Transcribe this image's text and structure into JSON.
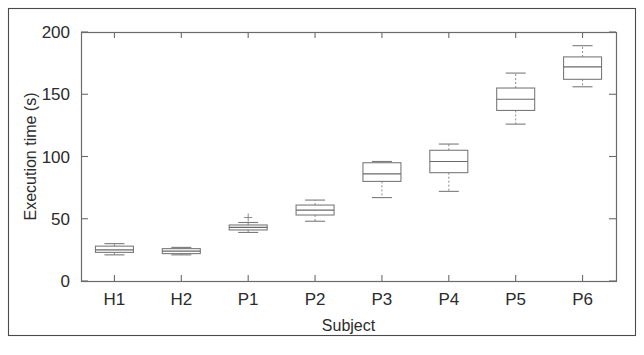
{
  "chart_data": {
    "type": "box",
    "title": "",
    "xlabel": "Subject",
    "ylabel": "Execution time (s)",
    "categories": [
      "H1",
      "H2",
      "P1",
      "P2",
      "P3",
      "P4",
      "P5",
      "P6"
    ],
    "ylim": [
      0,
      200
    ],
    "yticks": [
      0,
      50,
      100,
      150,
      200
    ],
    "ytick_labels": [
      "0",
      "50",
      "100",
      "150",
      "200"
    ],
    "grid": false,
    "legend": null,
    "boxes": [
      {
        "category": "H1",
        "whisker_low": 21,
        "q1": 23,
        "median": 25,
        "q3": 28,
        "whisker_high": 30,
        "outliers": []
      },
      {
        "category": "H2",
        "whisker_low": 21,
        "q1": 22,
        "median": 24,
        "q3": 26,
        "whisker_high": 27,
        "outliers": []
      },
      {
        "category": "P1",
        "whisker_low": 39,
        "q1": 41,
        "median": 43,
        "q3": 45,
        "whisker_high": 47,
        "outliers": [
          51
        ]
      },
      {
        "category": "P2",
        "whisker_low": 48,
        "q1": 53,
        "median": 57,
        "q3": 61,
        "whisker_high": 65,
        "outliers": []
      },
      {
        "category": "P3",
        "whisker_low": 67,
        "q1": 80,
        "median": 86,
        "q3": 95,
        "whisker_high": 96,
        "outliers": []
      },
      {
        "category": "P4",
        "whisker_low": 72,
        "q1": 87,
        "median": 96,
        "q3": 105,
        "whisker_high": 110,
        "outliers": []
      },
      {
        "category": "P5",
        "whisker_low": 126,
        "q1": 137,
        "median": 146,
        "q3": 155,
        "whisker_high": 167,
        "outliers": []
      },
      {
        "category": "P6",
        "whisker_low": 156,
        "q1": 162,
        "median": 172,
        "q3": 180,
        "whisker_high": 189,
        "outliers": []
      }
    ],
    "colors": {
      "box_stroke": "#7a7a7a",
      "median": "#6a6a6a",
      "whisker": "#8a8a8a",
      "axis": "#6b6b6b",
      "text": "#2b2b2b",
      "background": "#ffffff"
    }
  },
  "figure": {
    "border_visible": true
  }
}
